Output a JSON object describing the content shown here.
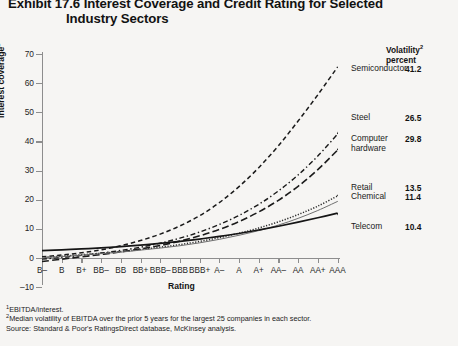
{
  "title": {
    "line1": "Exhibit 17.6 Interest Coverage and Credit Rating for Selected",
    "line2": "Industry Sectors"
  },
  "legend_header": {
    "line1": "Volatility",
    "line2": "percent",
    "sup": "2"
  },
  "axes": {
    "y_title": "Interest coverage",
    "y_title_sup": "1",
    "x_title": "Rating",
    "y_ticks": [
      70,
      60,
      50,
      40,
      30,
      20,
      10,
      0,
      -10
    ],
    "y_min": -10,
    "y_max": 70
  },
  "notes": [
    "EBITDA/interest.",
    "Median volatility of EBITDA over the prior 5 years for the largest 25 companies in each sector.",
    "Source: Standard & Poor's RatingsDirect database, McKinsey analysis."
  ],
  "note_sups": [
    "1",
    "2",
    ""
  ],
  "chart_data": {
    "type": "line",
    "title": "Exhibit 17.6 Interest Coverage and Credit Rating for Selected Industry Sectors",
    "xlabel": "Rating",
    "ylabel": "Interest coverage",
    "ylim": [
      -10,
      70
    ],
    "grid": false,
    "legend_position": "right-inline",
    "categories": [
      "B-",
      "B",
      "B+",
      "BB-",
      "BB",
      "BB+",
      "BBB-",
      "BBB",
      "BBB+",
      "A-",
      "A",
      "A+",
      "AA-",
      "AA",
      "AA+",
      "AAA"
    ],
    "series": [
      {
        "name": "Semiconductor",
        "volatility": "41.2",
        "style": "dashed",
        "color": "#1a1a1a",
        "values": [
          0.4,
          1.0,
          1.8,
          2.8,
          4.2,
          6.0,
          8.2,
          11.0,
          14.5,
          19.0,
          24.5,
          31.0,
          38.5,
          47.0,
          56.0,
          65.5
        ]
      },
      {
        "name": "Steel",
        "volatility": "26.5",
        "style": "dash-dot",
        "color": "#1a1a1a",
        "values": [
          -0.4,
          0.2,
          0.9,
          1.7,
          2.6,
          3.7,
          5.1,
          6.8,
          8.9,
          11.5,
          14.6,
          18.4,
          23.0,
          28.5,
          35.0,
          42.5
        ]
      },
      {
        "name": "Computer hardware",
        "volatility": "29.8",
        "style": "long-dash",
        "color": "#1a1a1a",
        "values": [
          -1.2,
          -0.4,
          0.4,
          1.2,
          2.1,
          3.1,
          4.3,
          5.8,
          7.6,
          9.8,
          12.5,
          15.8,
          19.8,
          24.6,
          30.3,
          37.0
        ]
      },
      {
        "name": "Retail",
        "volatility": "13.5",
        "style": "dotted",
        "color": "#2a2a2a",
        "values": [
          0.2,
          0.6,
          1.1,
          1.6,
          2.2,
          2.9,
          3.7,
          4.6,
          5.7,
          7.0,
          8.5,
          10.3,
          12.4,
          14.9,
          17.8,
          21.3
        ]
      },
      {
        "name": "Chemical",
        "volatility": "11.4",
        "style": "thin-solid",
        "color": "#6f6f6f",
        "values": [
          0.1,
          0.5,
          1.0,
          1.5,
          2.0,
          2.7,
          3.4,
          4.2,
          5.2,
          6.4,
          7.8,
          9.4,
          11.3,
          13.6,
          16.3,
          19.4
        ]
      },
      {
        "name": "Telecom",
        "volatility": "10.4",
        "style": "solid",
        "color": "#151515",
        "values": [
          2.5,
          2.8,
          3.1,
          3.5,
          3.9,
          4.4,
          5.0,
          5.7,
          6.5,
          7.4,
          8.4,
          9.6,
          10.9,
          12.3,
          13.8,
          15.4
        ]
      }
    ]
  },
  "series_labels": [
    {
      "name": "Semiconductor",
      "value": "41.2"
    },
    {
      "name": "Steel",
      "value": "26.5"
    },
    {
      "name": "Computer",
      "name2": "hardware",
      "value": "29.8"
    },
    {
      "name": "Retail",
      "value": "13.5"
    },
    {
      "name": "Chemical",
      "value": "11.4"
    },
    {
      "name": "Telecom",
      "value": "10.4"
    }
  ]
}
